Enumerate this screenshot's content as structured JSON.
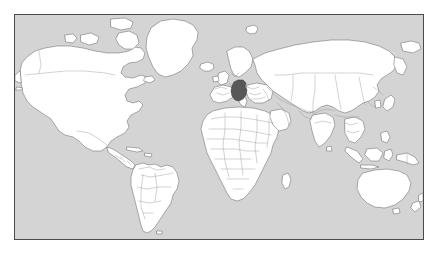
{
  "figure": {
    "kind": "world-map",
    "width_px": 439,
    "height_px": 256,
    "frame": {
      "left_px": 14,
      "top_px": 14,
      "width_px": 410,
      "height_px": 226,
      "border_color": "#4a4a4a",
      "border_width_px": 1
    }
  },
  "map": {
    "projection": "equirectangular",
    "lon_range": [
      -180,
      180
    ],
    "lat_range": [
      -58,
      84
    ],
    "ocean_color": "#d4d4d4",
    "land_color": "#ffffff",
    "coast_color": "#6e6e6e",
    "border_color": "#8e8e8e",
    "highlight_color": "#585858",
    "graticule": false,
    "labels": false,
    "legend": false
  },
  "highlight": {
    "name": "Germany",
    "color": "#585858",
    "approx_center_px": [
      232,
      92
    ],
    "approx_lonlat": [
      10.4,
      51.2
    ]
  },
  "regions_visible": [
    "North America",
    "Greenland",
    "Iceland",
    "South America",
    "Europe",
    "Africa",
    "Asia",
    "Russia",
    "India",
    "Southeast Asia",
    "Indonesia",
    "Australia",
    "New Zealand",
    "Japan",
    "Madagascar",
    "British Isles",
    "Scandinavia"
  ]
}
